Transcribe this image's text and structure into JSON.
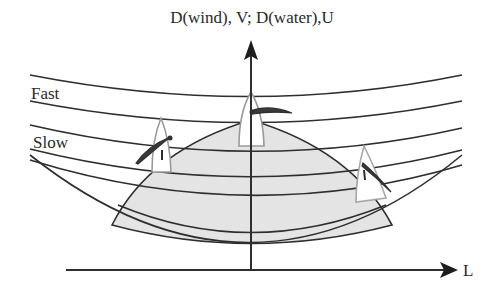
{
  "figure": {
    "title": "D(wind), V;  D(water),U",
    "x_axis_label": "L",
    "curve_labels": {
      "fast": "Fast",
      "slow": "Slow"
    },
    "colors": {
      "line": "#2e2e2e",
      "shaded_region": "#e4e4e4",
      "boat_hull": "#9a9a9a",
      "boat_sail": "#3a3a3a"
    },
    "elements": {
      "y_axis": "vertical axis with arrow up",
      "x_axis": "horizontal axis with arrow right",
      "wind_curves": 5,
      "shaded_region": "dome-shaped water region bounded by lower curves",
      "boats": 3
    }
  }
}
